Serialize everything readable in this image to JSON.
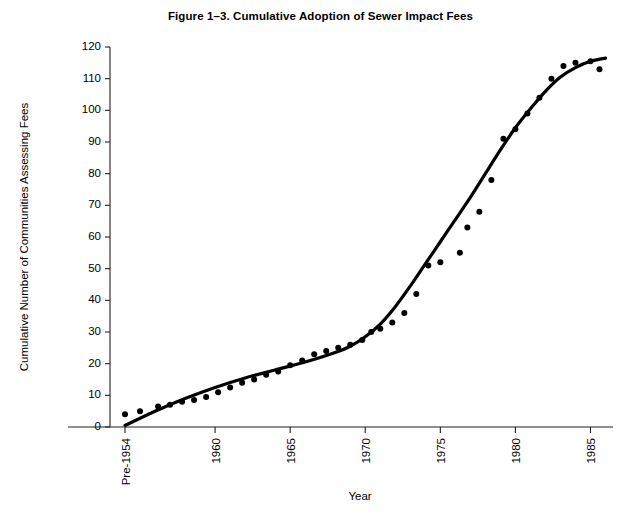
{
  "figure": {
    "title": "Figure 1–3. Cumulative Adoption of Sewer Impact Fees"
  },
  "chart_data": {
    "type": "scatter",
    "title": "Figure 1–3. Cumulative Adoption of Sewer Impact Fees",
    "xlabel": "Year",
    "ylabel": "Cumulative Number of Communities Assessing Fees",
    "xlim": [
      1953.0,
      1986.5
    ],
    "ylim": [
      0,
      120
    ],
    "grid": false,
    "legend": null,
    "y_ticks": [
      0,
      10,
      20,
      30,
      40,
      50,
      60,
      70,
      80,
      90,
      100,
      110,
      120
    ],
    "y_tick_labels": [
      "0",
      "10",
      "20",
      "30",
      "40",
      "50",
      "60",
      "70",
      "80",
      "90",
      "100",
      "110",
      "120"
    ],
    "x_ticks": [
      1954,
      1960,
      1965,
      1970,
      1975,
      1980,
      1985
    ],
    "x_tick_labels": [
      "Pre-1954",
      "1960",
      "1965",
      "1970",
      "1975",
      "1980",
      "1985"
    ],
    "x_tick_rotation": 90,
    "series": [
      {
        "name": "Observed cumulative adoptions",
        "type": "scatter",
        "marker": "filled-circle",
        "color": "#000000",
        "x": [
          1954.0,
          1955.0,
          1956.2,
          1957.0,
          1957.8,
          1958.6,
          1959.4,
          1960.2,
          1961.0,
          1961.8,
          1962.6,
          1963.4,
          1964.2,
          1965.0,
          1965.8,
          1966.6,
          1967.4,
          1968.2,
          1969.0,
          1969.8,
          1970.4,
          1971.0,
          1971.8,
          1972.6,
          1973.4,
          1974.2,
          1975.0,
          1976.3,
          1976.8,
          1977.6,
          1978.4,
          1979.2,
          1980.0,
          1980.8,
          1981.6,
          1982.4,
          1983.2,
          1984.0,
          1985.0,
          1985.6
        ],
        "y": [
          4.0,
          5.0,
          6.5,
          7.0,
          8.0,
          8.5,
          9.5,
          11.0,
          12.5,
          14.0,
          15.0,
          16.5,
          17.5,
          19.5,
          21.0,
          23.0,
          24.0,
          25.0,
          26.0,
          27.5,
          30.0,
          31.0,
          33.0,
          36.0,
          42.0,
          51.0,
          52.0,
          55.0,
          63.0,
          68.0,
          78.0,
          91.0,
          94.0,
          99.0,
          104.0,
          110.0,
          114.0,
          115.0,
          115.5,
          113.0
        ]
      },
      {
        "name": "Fitted cumulative adoption curve",
        "type": "line",
        "color": "#000000",
        "x": [
          1954.0,
          1956.0,
          1958.0,
          1960.0,
          1962.0,
          1964.0,
          1966.0,
          1968.0,
          1969.0,
          1970.0,
          1971.0,
          1972.0,
          1973.0,
          1974.0,
          1975.0,
          1976.0,
          1977.0,
          1978.0,
          1979.0,
          1980.0,
          1981.0,
          1982.0,
          1983.0,
          1984.0,
          1985.0,
          1986.0
        ],
        "y": [
          0.5,
          5.0,
          9.0,
          12.5,
          15.5,
          18.0,
          20.5,
          23.5,
          25.5,
          28.5,
          32.5,
          38.0,
          44.5,
          51.5,
          58.5,
          65.5,
          72.5,
          80.0,
          87.5,
          94.5,
          100.5,
          106.0,
          110.5,
          113.5,
          115.5,
          116.5
        ]
      }
    ]
  }
}
